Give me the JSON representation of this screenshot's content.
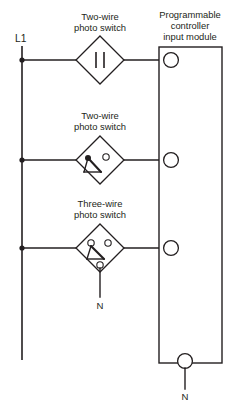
{
  "diagram": {
    "title_module": {
      "line1": "Programmable",
      "line2": "controller",
      "line3": "input module"
    },
    "power_rail": {
      "label": "L1"
    },
    "branches": [
      {
        "id": "branch-1",
        "label_line1": "Two-wire",
        "label_line2": "photo switch",
        "symbol": "two-bar-solid-state",
        "terminal": "input-terminal-1"
      },
      {
        "id": "branch-2",
        "label_line1": "Two-wire",
        "label_line2": "photo switch",
        "symbol": "two-wire-contact",
        "terminal": "input-terminal-2"
      },
      {
        "id": "branch-3",
        "label_line1": "Three-wire",
        "label_line2": "photo switch",
        "symbol": "three-wire-contact",
        "terminal": "input-terminal-3",
        "neutral_label": "N"
      }
    ],
    "module_neutral": {
      "label": "N"
    },
    "colors": {
      "line": "#231f20",
      "background": "#ffffff"
    }
  }
}
